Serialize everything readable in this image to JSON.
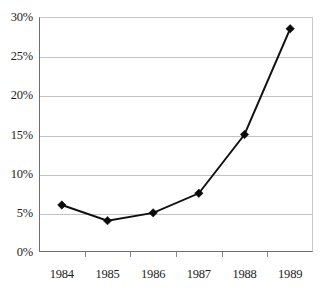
{
  "chart_data": {
    "type": "line",
    "title": "",
    "subtitle": "",
    "xlabel": "",
    "ylabel": "",
    "categories": [
      "1984",
      "1985",
      "1986",
      "1987",
      "1988",
      "1989"
    ],
    "values": [
      6,
      4,
      5,
      7.5,
      15,
      28.5
    ],
    "series": [
      {
        "name": "",
        "values": [
          6,
          4,
          5,
          7.5,
          15,
          28.5
        ]
      }
    ],
    "ylim": [
      0,
      30
    ],
    "ytick_labels": [
      "0%",
      "5%",
      "10%",
      "15%",
      "20%",
      "25%",
      "30%"
    ],
    "ytick_values": [
      0,
      5,
      10,
      15,
      20,
      25,
      30
    ],
    "xtick_labels": [
      "1984",
      "1985",
      "1986",
      "1987",
      "1988",
      "1989"
    ],
    "value_format": "percent",
    "grid": "horizontal",
    "legend": "none",
    "marker": "diamond",
    "annotations": [],
    "colors": {
      "line": "#101010",
      "marker": "#0b0b0b",
      "gridline": "#c2c2c2",
      "axis": "#6e6e6e",
      "plot_background": "#ffffff",
      "text": "#1c1c1c"
    }
  }
}
